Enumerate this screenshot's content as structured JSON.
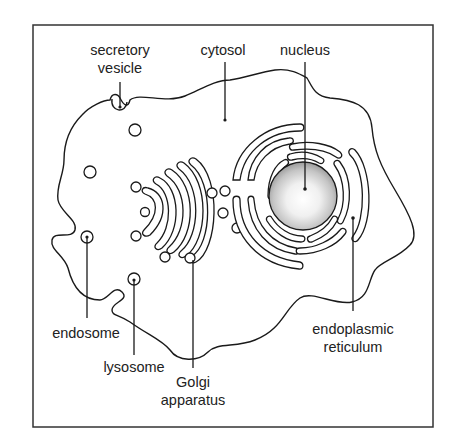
{
  "diagram": {
    "type": "cell-structure-illustration",
    "labels": {
      "secretory_vesicle_line1": "secretory",
      "secretory_vesicle_line2": "vesicle",
      "cytosol": "cytosol",
      "nucleus": "nucleus",
      "endosome": "endosome",
      "lysosome": "lysosome",
      "golgi_line1": "Golgi",
      "golgi_line2": "apparatus",
      "er_line1": "endoplasmic",
      "er_line2": "reticulum"
    },
    "colors": {
      "stroke": "#1a1a1a",
      "text": "#222222",
      "frame": "#333333",
      "nucleus_center": "#ffffff",
      "nucleus_edge": "#9a9a9a"
    }
  }
}
